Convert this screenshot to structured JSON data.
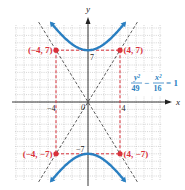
{
  "chart_data": {
    "type": "line",
    "title": "",
    "xlabel": "x",
    "ylabel": "y",
    "xlim": [
      -9,
      9
    ],
    "ylim": [
      -10.5,
      10.5
    ],
    "grid": true,
    "equation": {
      "num1": "y²",
      "den1": "49",
      "minus": "−",
      "num2": "x²",
      "den2": "16",
      "rhs": "= 1"
    },
    "tick_labels": {
      "x_neg": "−4",
      "x_pos": "4",
      "y_pos": "7",
      "y_neg": "−7",
      "origin": "0"
    },
    "series": [
      {
        "name": "hyperbola upper branch",
        "color": "#2a7fc1",
        "equation": "y = 7*sqrt(1 + x^2/16)",
        "x_range": [
          -5,
          5
        ]
      },
      {
        "name": "hyperbola lower branch",
        "color": "#2a7fc1",
        "equation": "y = -7*sqrt(1 + x^2/16)",
        "x_range": [
          -5,
          5
        ]
      },
      {
        "name": "asymptote",
        "color": "#333333",
        "equation": "y = 7/4 x",
        "style": "dashed"
      },
      {
        "name": "asymptote",
        "color": "#333333",
        "equation": "y = -7/4 x",
        "style": "dashed"
      }
    ],
    "points": [
      {
        "label": "(−4, 7)",
        "x": -4,
        "y": 7
      },
      {
        "label": "(4, 7)",
        "x": 4,
        "y": 7
      },
      {
        "label": "(−4, −7)",
        "x": -4,
        "y": -7
      },
      {
        "label": "(4, −7)",
        "x": 4,
        "y": -7
      }
    ],
    "rectangle": {
      "x": [
        -4,
        4
      ],
      "y": [
        -7,
        7
      ],
      "color": "#d9303a",
      "style": "dashed"
    },
    "colors": {
      "curve": "#2a7fc1",
      "points": "#d9303a",
      "asymptote": "#333333",
      "equation": "#2a7fc1"
    }
  }
}
